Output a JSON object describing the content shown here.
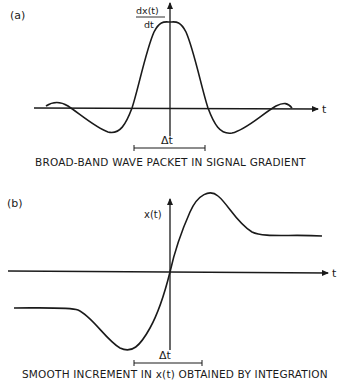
{
  "panel_a": {
    "label": "(a)",
    "y_axis_label_num": "dx(t)",
    "y_axis_label_den": "dt",
    "x_axis_label": "t",
    "interval_label": "Δt",
    "caption": "BROAD-BAND WAVE PACKET IN SIGNAL GRADIENT"
  },
  "panel_b": {
    "label": "(b)",
    "y_axis_label": "x(t)",
    "x_axis_label": "t",
    "interval_label": "Δt",
    "caption": "SMOOTH INCREMENT IN x(t) OBTAINED BY INTEGRATION"
  },
  "colors": {
    "ink": "#1a1a1a",
    "background": "#ffffff"
  }
}
